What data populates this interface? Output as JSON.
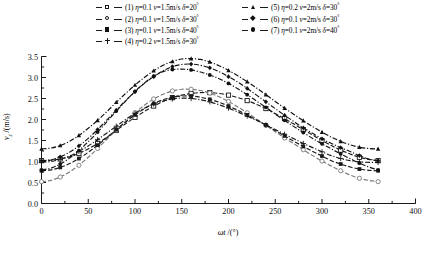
{
  "chart_data": {
    "type": "line",
    "title": "",
    "xlabel": "ωt /(°)",
    "ylabel": "vᴢ /(m/s)",
    "xlim": [
      0,
      400
    ],
    "ylim": [
      0.0,
      3.5
    ],
    "xticks": [
      0,
      50,
      100,
      150,
      200,
      250,
      300,
      350,
      400
    ],
    "xtick_labels": [
      "0",
      "50",
      "100",
      "150",
      "200",
      "250",
      "300",
      "350",
      "400"
    ],
    "yticks": [
      0.0,
      0.5,
      1.0,
      1.5,
      2.0,
      2.5,
      3.0,
      3.5
    ],
    "ytick_labels": [
      "0.0",
      "0.5",
      "1.0",
      "1.5",
      "2.0",
      "2.5",
      "3.0",
      "3.5"
    ],
    "grid": false,
    "legend_position": "top",
    "x": [
      0,
      10,
      20,
      30,
      40,
      50,
      60,
      70,
      80,
      90,
      100,
      110,
      120,
      130,
      140,
      150,
      160,
      170,
      180,
      190,
      200,
      210,
      220,
      230,
      240,
      250,
      260,
      270,
      280,
      290,
      300,
      310,
      320,
      330,
      340,
      350,
      360
    ],
    "series": [
      {
        "name": "(1) η=0.1 v=1.5m/s δ=20°",
        "marker": "square-open",
        "linestyle": "dashed",
        "color": "#1a1a1a",
        "values": [
          1.02,
          1.03,
          1.06,
          1.11,
          1.19,
          1.3,
          1.43,
          1.58,
          1.74,
          1.9,
          2.05,
          2.19,
          2.32,
          2.43,
          2.52,
          2.58,
          2.62,
          2.64,
          2.64,
          2.62,
          2.58,
          2.52,
          2.45,
          2.36,
          2.26,
          2.14,
          2.02,
          1.89,
          1.76,
          1.63,
          1.5,
          1.38,
          1.27,
          1.18,
          1.1,
          1.05,
          1.02
        ]
      },
      {
        "name": "(2) η=0.1 v=1.5m/s δ=30°",
        "marker": "circle-open",
        "linestyle": "dashed",
        "color": "#7a7a7a",
        "values": [
          0.52,
          0.55,
          0.63,
          0.75,
          0.91,
          1.1,
          1.31,
          1.53,
          1.75,
          1.96,
          2.16,
          2.34,
          2.49,
          2.6,
          2.68,
          2.72,
          2.72,
          2.69,
          2.63,
          2.54,
          2.43,
          2.3,
          2.16,
          2.01,
          1.86,
          1.71,
          1.56,
          1.42,
          1.28,
          1.14,
          1.01,
          0.89,
          0.78,
          0.68,
          0.6,
          0.55,
          0.52
        ]
      },
      {
        "name": "(3) η=0.1 v=1.5m/s δ=40°",
        "marker": "square-fill",
        "linestyle": "dashed",
        "color": "#1a1a1a",
        "values": [
          0.78,
          0.8,
          0.86,
          0.95,
          1.07,
          1.22,
          1.39,
          1.57,
          1.76,
          1.94,
          2.11,
          2.26,
          2.38,
          2.47,
          2.53,
          2.56,
          2.56,
          2.53,
          2.48,
          2.41,
          2.32,
          2.22,
          2.11,
          1.99,
          1.87,
          1.74,
          1.61,
          1.48,
          1.36,
          1.24,
          1.13,
          1.02,
          0.94,
          0.87,
          0.82,
          0.79,
          0.78
        ]
      },
      {
        "name": "(4) η=0.2 v=1.5m/s δ=30°",
        "marker": "plus",
        "linestyle": "dash-dot",
        "color": "#1a1a1a",
        "values": [
          0.98,
          1.0,
          1.05,
          1.13,
          1.24,
          1.37,
          1.52,
          1.68,
          1.84,
          2.0,
          2.15,
          2.27,
          2.37,
          2.44,
          2.49,
          2.51,
          2.5,
          2.47,
          2.42,
          2.35,
          2.27,
          2.18,
          2.08,
          1.98,
          1.87,
          1.76,
          1.65,
          1.54,
          1.43,
          1.33,
          1.23,
          1.14,
          1.07,
          1.02,
          0.99,
          0.98,
          0.98
        ]
      },
      {
        "name": "(5) η=0.2 v=2m/s δ=30°",
        "marker": "triangle-fill",
        "linestyle": "dash-dot",
        "color": "#111111",
        "values": [
          1.3,
          1.32,
          1.38,
          1.48,
          1.62,
          1.79,
          1.98,
          2.19,
          2.41,
          2.62,
          2.82,
          3.0,
          3.16,
          3.29,
          3.38,
          3.44,
          3.45,
          3.43,
          3.37,
          3.28,
          3.17,
          3.04,
          2.9,
          2.75,
          2.59,
          2.43,
          2.27,
          2.12,
          1.97,
          1.83,
          1.7,
          1.58,
          1.48,
          1.4,
          1.34,
          1.31,
          1.3
        ]
      },
      {
        "name": "(6) η=0.1 v=2m/s δ=30°",
        "marker": "diamond-fill",
        "linestyle": "dash-dot",
        "color": "#111111",
        "values": [
          1.02,
          1.04,
          1.11,
          1.22,
          1.37,
          1.55,
          1.76,
          1.99,
          2.22,
          2.45,
          2.66,
          2.86,
          3.02,
          3.16,
          3.26,
          3.31,
          3.32,
          3.29,
          3.23,
          3.14,
          3.02,
          2.89,
          2.74,
          2.58,
          2.42,
          2.26,
          2.1,
          1.95,
          1.8,
          1.67,
          1.54,
          1.43,
          1.33,
          1.24,
          1.14,
          1.06,
          1.02
        ]
      },
      {
        "name": "(7) η=0.1 v=2m/s δ=40°",
        "marker": "circle-fill",
        "linestyle": "dash-dot",
        "color": "#111111",
        "values": [
          0.8,
          0.84,
          0.94,
          1.08,
          1.26,
          1.47,
          1.7,
          1.95,
          2.2,
          2.44,
          2.67,
          2.87,
          3.03,
          3.14,
          3.19,
          3.2,
          3.18,
          3.13,
          3.06,
          2.97,
          2.86,
          2.73,
          2.59,
          2.44,
          2.29,
          2.13,
          1.98,
          1.83,
          1.69,
          1.55,
          1.42,
          1.3,
          1.18,
          1.07,
          0.96,
          0.87,
          0.8
        ]
      }
    ]
  },
  "legend": {
    "entries": [
      {
        "index": "(1)",
        "eta_label": "η",
        "eta_value": "=0.1",
        "v_label": "v",
        "v_value": "=1.5m/s",
        "delta_label": "δ",
        "delta_value": "=20",
        "degree": "°",
        "marker": "square-open"
      },
      {
        "index": "(2)",
        "eta_label": "η",
        "eta_value": "=0.1",
        "v_label": "v",
        "v_value": "=1.5m/s",
        "delta_label": "δ",
        "delta_value": "=30",
        "degree": "°",
        "marker": "circle-open"
      },
      {
        "index": "(3)",
        "eta_label": "η",
        "eta_value": "=0.1",
        "v_label": "v",
        "v_value": "=1.5m/s",
        "delta_label": "δ",
        "delta_value": "=40",
        "degree": "°",
        "marker": "square-fill"
      },
      {
        "index": "(4)",
        "eta_label": "η",
        "eta_value": "=0.2",
        "v_label": "v",
        "v_value": "=1.5m/s",
        "delta_label": "δ",
        "delta_value": "=30",
        "degree": "°",
        "marker": "plus"
      },
      {
        "index": "(5)",
        "eta_label": "η",
        "eta_value": "=0.2",
        "v_label": "v",
        "v_value": "=2m/s",
        "delta_label": "δ",
        "delta_value": "=30",
        "degree": "°",
        "marker": "triangle-fill"
      },
      {
        "index": "(6)",
        "eta_label": "η",
        "eta_value": "=0.1",
        "v_label": "v",
        "v_value": "=2m/s",
        "delta_label": "δ",
        "delta_value": "=30",
        "degree": "°",
        "marker": "diamond-fill"
      },
      {
        "index": "(7)",
        "eta_label": "η",
        "eta_value": "=0.1",
        "v_label": "v",
        "v_value": "=2m/s",
        "delta_label": "δ",
        "delta_value": "=40",
        "degree": "°",
        "marker": "circle-fill"
      }
    ]
  },
  "axes": {
    "x_title_symbol": "ωt",
    "x_title_unit": " /(°)",
    "y_title_symbol": "v",
    "y_title_sub": "z",
    "y_title_unit": " /(m/s)"
  },
  "caption": ""
}
